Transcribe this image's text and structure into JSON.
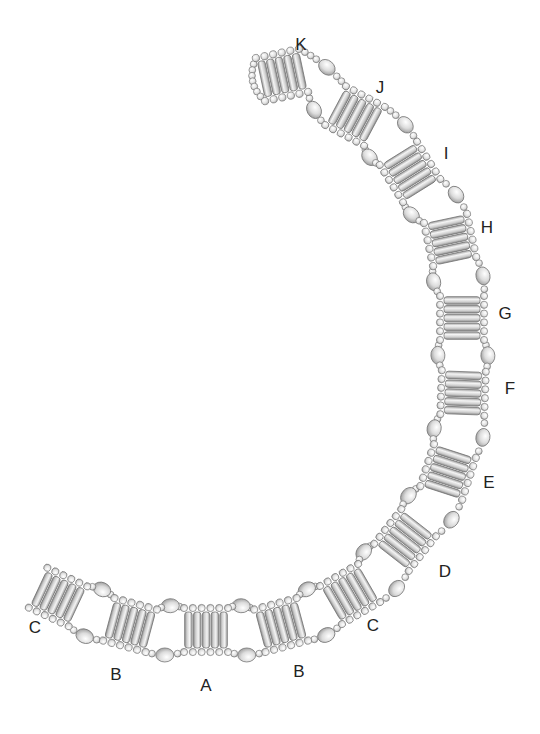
{
  "colors": {
    "bead_stroke": "#777777",
    "bead_fill": "#e6e6e6",
    "bugle_fill": "#d4d4d4",
    "label": "#222222"
  },
  "segments": [
    {
      "id": "K",
      "label": "K",
      "cx": 282,
      "cy": 75,
      "rot": -12,
      "lx": 301,
      "ly": 45
    },
    {
      "id": "J",
      "label": "J",
      "cx": 355,
      "cy": 116,
      "rot": 28,
      "lx": 380,
      "ly": 88
    },
    {
      "id": "I",
      "label": "I",
      "cx": 410,
      "cy": 172,
      "rot": 58,
      "lx": 446,
      "ly": 154
    },
    {
      "id": "H",
      "label": "H",
      "cx": 450,
      "cy": 240,
      "rot": 78,
      "lx": 487,
      "ly": 228
    },
    {
      "id": "G",
      "label": "G",
      "cx": 462,
      "cy": 318,
      "rot": 90,
      "lx": 505,
      "ly": 314
    },
    {
      "id": "F",
      "label": "F",
      "cx": 463,
      "cy": 393,
      "rot": 92,
      "lx": 510,
      "ly": 389
    },
    {
      "id": "E",
      "label": "E",
      "cx": 448,
      "cy": 472,
      "rot": 108,
      "lx": 489,
      "ly": 483
    },
    {
      "id": "D",
      "label": "D",
      "cx": 405,
      "cy": 540,
      "rot": 128,
      "lx": 445,
      "ly": 572
    },
    {
      "id": "C-right",
      "label": "C",
      "cx": 350,
      "cy": 594,
      "rot": 150,
      "lx": 373,
      "ly": 626
    },
    {
      "id": "B-right",
      "label": "B",
      "cx": 281,
      "cy": 625,
      "rot": 165,
      "lx": 299,
      "ly": 672
    },
    {
      "id": "A",
      "label": "A",
      "cx": 206,
      "cy": 630,
      "rot": 180,
      "lx": 206,
      "ly": 686
    },
    {
      "id": "B-left",
      "label": "B",
      "cx": 130,
      "cy": 625,
      "rot": 195,
      "lx": 116,
      "ly": 675
    },
    {
      "id": "C-left",
      "label": "C",
      "cx": 58,
      "cy": 597,
      "rot": 205,
      "lx": 35,
      "ly": 628
    }
  ]
}
